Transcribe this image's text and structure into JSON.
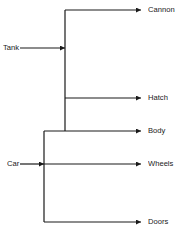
{
  "diagram": {
    "type": "composition-tree",
    "colors": {
      "line": "#1a1a1a",
      "background": "#ffffff"
    },
    "sources": [
      {
        "label": "Tank",
        "x": 3,
        "y": 48,
        "joins_x": 65
      },
      {
        "label": "Car",
        "x": 7,
        "y": 164,
        "joins_x": 44
      }
    ],
    "targets": [
      {
        "label": "Cannon",
        "y": 10
      },
      {
        "label": "Hatch",
        "y": 98
      },
      {
        "label": "Body",
        "y": 131
      },
      {
        "label": "Wheels",
        "y": 164
      },
      {
        "label": "Doors",
        "y": 222
      }
    ],
    "edges": [
      {
        "from": "Tank",
        "to": [
          "Cannon",
          "Hatch",
          "Body"
        ]
      },
      {
        "from": "Car",
        "to": [
          "Body",
          "Wheels",
          "Doors"
        ]
      }
    ]
  }
}
